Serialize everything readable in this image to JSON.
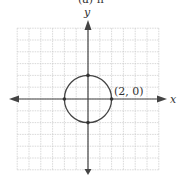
{
  "figure": {
    "top_partial_text": "(a) h",
    "x_axis_label": "x",
    "y_axis_label": "y",
    "point_label": "(2, 0)",
    "colors": {
      "grid": "#c8c8c8",
      "axis": "#444444",
      "curve": "#444444",
      "background": "#ffffff"
    }
  },
  "chart_data": {
    "type": "scatter",
    "title": "",
    "xlabel": "x",
    "ylabel": "y",
    "xlim": [
      -6,
      6
    ],
    "ylim": [
      -6,
      6
    ],
    "grid": true,
    "shape": {
      "kind": "circle",
      "center": [
        0,
        0
      ],
      "radius": 2
    },
    "points": [
      {
        "x": 2,
        "y": 0,
        "label": "(2, 0)"
      },
      {
        "x": -2,
        "y": 0
      },
      {
        "x": 0,
        "y": 2
      },
      {
        "x": 0,
        "y": -2
      }
    ],
    "annotations": [
      "(2, 0)"
    ]
  }
}
